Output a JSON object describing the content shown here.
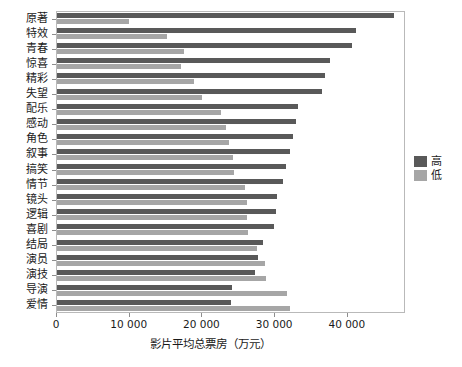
{
  "chart_data": {
    "type": "bar",
    "orientation": "horizontal",
    "title": "",
    "xlabel": "影片平均总票房（万元）",
    "ylabel": "",
    "xlim": [
      0,
      48000
    ],
    "ylim": null,
    "grid": false,
    "legend_position": "right",
    "xticks": [
      "0",
      "10 000",
      "20 000",
      "30 000",
      "40 000"
    ],
    "xtick_values": [
      0,
      10000,
      20000,
      30000,
      40000
    ],
    "categories": [
      "原著",
      "特效",
      "青春",
      "惊喜",
      "精彩",
      "失望",
      "配乐",
      "感动",
      "角色",
      "叙事",
      "搞笑",
      "情节",
      "镜头",
      "逻辑",
      "喜剧",
      "结局",
      "演员",
      "演技",
      "导演",
      "爱情"
    ],
    "series": [
      {
        "name": "高",
        "color": "#595959",
        "values": [
          46400,
          41100,
          40600,
          37600,
          36800,
          36400,
          33200,
          32900,
          32500,
          32100,
          31500,
          31100,
          30300,
          30100,
          29900,
          28300,
          27600,
          27200,
          24000,
          23900
        ]
      },
      {
        "name": "低",
        "color": "#a6a6a6",
        "values": [
          9900,
          15100,
          17400,
          17000,
          18900,
          19900,
          22500,
          23300,
          23600,
          24200,
          24400,
          25800,
          26100,
          26100,
          26300,
          27500,
          28600,
          28800,
          31700,
          32100
        ]
      }
    ]
  },
  "legend": {
    "entries": [
      {
        "label": "高",
        "color": "#595959"
      },
      {
        "label": "低",
        "color": "#a6a6a6"
      }
    ]
  },
  "axis": {
    "x_title": "影片平均总票房（万元）"
  }
}
